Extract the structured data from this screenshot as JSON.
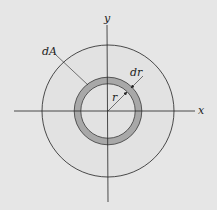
{
  "diagram": {
    "labels": {
      "x_axis": "x",
      "y_axis": "y",
      "area_element": "dA",
      "radius": "r",
      "ring_width": "dr"
    },
    "colors": {
      "background": "#e6e6e6",
      "outer_disk": "#e2e2e2",
      "ring_fill": "#a8a8a8",
      "stroke": "#222222"
    }
  }
}
